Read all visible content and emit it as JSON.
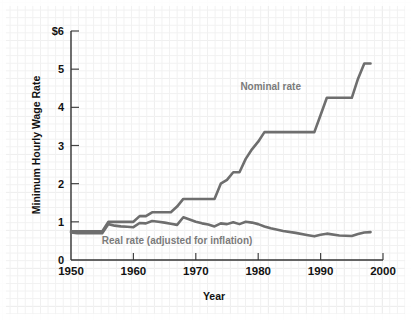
{
  "chart_data": {
    "type": "line",
    "title": "",
    "xlabel": "Year",
    "ylabel": "Minimum Hourly Wage Rate",
    "xlim": [
      1950,
      2000
    ],
    "ylim": [
      0,
      6
    ],
    "grid": true,
    "legend_position": "inline-annotation",
    "x_ticks": [
      "1950",
      "1960",
      "1970",
      "1980",
      "1990",
      "2000"
    ],
    "x_tick_values": [
      1950,
      1960,
      1970,
      1980,
      1990,
      2000
    ],
    "y_ticks": [
      "0",
      "1",
      "2",
      "3",
      "4",
      "5",
      "$6"
    ],
    "y_tick_values": [
      0,
      1,
      2,
      3,
      4,
      5,
      6
    ],
    "line_color": "#6e6e6e",
    "annotation_color": "#7b7b7b",
    "axis_color": "#333333",
    "series": [
      {
        "name": "Nominal rate",
        "label": "Nominal rate",
        "label_x": 1982,
        "label_y": 4.45,
        "color": "#6e6e6e",
        "x": [
          1950,
          1955,
          1956,
          1957,
          1958,
          1959,
          1960,
          1961,
          1962,
          1963,
          1964,
          1966,
          1967,
          1968,
          1969,
          1970,
          1973,
          1974,
          1975,
          1976,
          1977,
          1978,
          1979,
          1980,
          1981,
          1989,
          1990,
          1991,
          1995,
          1996,
          1997,
          1998
        ],
        "values": [
          0.75,
          0.75,
          1.0,
          1.0,
          1.0,
          1.0,
          1.0,
          1.15,
          1.15,
          1.25,
          1.25,
          1.25,
          1.4,
          1.6,
          1.6,
          1.6,
          1.6,
          2.0,
          2.1,
          2.3,
          2.3,
          2.65,
          2.9,
          3.1,
          3.35,
          3.35,
          3.8,
          4.25,
          4.25,
          4.75,
          5.15,
          5.15
        ]
      },
      {
        "name": "Real rate (adjusted for inflation)",
        "label": "Real rate (adjusted for inflation)",
        "label_x": 1967,
        "label_y": 0.43,
        "color": "#6e6e6e",
        "x": [
          1950,
          1951,
          1953,
          1955,
          1956,
          1957,
          1958,
          1959,
          1960,
          1961,
          1962,
          1963,
          1964,
          1965,
          1966,
          1967,
          1968,
          1969,
          1970,
          1971,
          1972,
          1973,
          1974,
          1975,
          1976,
          1977,
          1978,
          1979,
          1980,
          1981,
          1982,
          1984,
          1986,
          1988,
          1989,
          1990,
          1991,
          1993,
          1995,
          1996,
          1997,
          1998
        ],
        "values": [
          0.72,
          0.7,
          0.7,
          0.7,
          0.94,
          0.9,
          0.88,
          0.87,
          0.86,
          0.97,
          0.96,
          1.02,
          1.0,
          0.98,
          0.95,
          0.92,
          1.12,
          1.06,
          1.0,
          0.96,
          0.93,
          0.88,
          0.96,
          0.94,
          0.99,
          0.94,
          1.0,
          0.98,
          0.94,
          0.88,
          0.83,
          0.76,
          0.71,
          0.65,
          0.62,
          0.66,
          0.69,
          0.64,
          0.63,
          0.68,
          0.72,
          0.73
        ]
      }
    ]
  },
  "axis": {
    "y_title": "Minimum Hourly Wage Rate",
    "x_title": "Year"
  }
}
